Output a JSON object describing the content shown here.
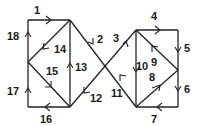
{
  "diagram": {
    "type": "directed-graph",
    "vertices": {
      "A": [
        28,
        20
      ],
      "B": [
        70,
        20
      ],
      "C": [
        28,
        62
      ],
      "D": [
        28,
        107
      ],
      "E": [
        70,
        107
      ],
      "F": [
        136,
        30
      ],
      "G": [
        178,
        30
      ],
      "H": [
        178,
        70
      ],
      "I": [
        178,
        107
      ],
      "J": [
        136,
        107
      ]
    },
    "edges": [
      {
        "id": "1",
        "label": "1",
        "from": "A",
        "to": "B",
        "lx": 34,
        "ly": 14
      },
      {
        "id": "2",
        "label": "2",
        "from": "B",
        "to": "J",
        "lx": 97,
        "ly": 43
      },
      {
        "id": "3",
        "label": "3",
        "from": "E",
        "to": "F",
        "lx": 114,
        "ly": 42
      },
      {
        "id": "4",
        "label": "4",
        "from": "F",
        "to": "G",
        "lx": 152,
        "ly": 20
      },
      {
        "id": "5",
        "label": "5",
        "from": "G",
        "to": "H",
        "lx": 184,
        "ly": 52
      },
      {
        "id": "6",
        "label": "6",
        "from": "H",
        "to": "I",
        "lx": 184,
        "ly": 93
      },
      {
        "id": "7",
        "label": "7",
        "from": "I",
        "to": "J",
        "lx": 152,
        "ly": 122
      },
      {
        "id": "8",
        "label": "8",
        "from": "J",
        "to": "H",
        "lx": 149,
        "ly": 80
      },
      {
        "id": "9",
        "label": "9",
        "from": "H",
        "to": "F",
        "lx": 151,
        "ly": 65
      },
      {
        "id": "10",
        "label": "10",
        "from": "F",
        "to": "J",
        "lx": 137,
        "ly": 71
      },
      {
        "id": "11",
        "label": "11",
        "from": "J",
        "to": "B",
        "lx": 112,
        "ly": 96
      },
      {
        "id": "12",
        "label": "12",
        "from": "F",
        "to": "E",
        "lx": 90,
        "ly": 101
      },
      {
        "id": "13",
        "label": "13",
        "from": "E",
        "to": "B",
        "lx": 76,
        "ly": 71
      },
      {
        "id": "14",
        "label": "14",
        "from": "B",
        "to": "C",
        "lx": 54,
        "ly": 52
      },
      {
        "id": "15",
        "label": "15",
        "from": "C",
        "to": "E",
        "lx": 47,
        "ly": 75
      },
      {
        "id": "16",
        "label": "16",
        "from": "E",
        "to": "D",
        "lx": 41,
        "ly": 122
      },
      {
        "id": "17",
        "label": "17",
        "from": "D",
        "to": "C",
        "lx": 8,
        "ly": 94
      },
      {
        "id": "18",
        "label": "18",
        "from": "C",
        "to": "A",
        "lx": 8,
        "ly": 40
      }
    ]
  }
}
